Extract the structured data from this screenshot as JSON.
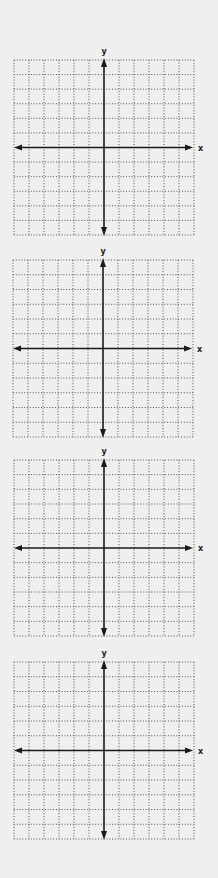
{
  "page": {
    "background": "#efefed",
    "grid_color": "#555555",
    "axis_color": "#1a1a1a"
  },
  "graphs": [
    {
      "id": "graph-1",
      "x_axis_label": "x",
      "y_axis_label": "y",
      "grid_cells_x": 12,
      "grid_cells_y": 12
    },
    {
      "id": "graph-2",
      "x_axis_label": "x",
      "y_axis_label": "y",
      "grid_cells_x": 12,
      "grid_cells_y": 12
    },
    {
      "id": "graph-3",
      "x_axis_label": "x",
      "y_axis_label": "y",
      "grid_cells_x": 12,
      "grid_cells_y": 12
    },
    {
      "id": "graph-4",
      "x_axis_label": "x",
      "y_axis_label": "y",
      "grid_cells_x": 12,
      "grid_cells_y": 12
    }
  ]
}
